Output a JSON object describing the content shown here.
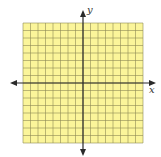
{
  "diagram": {
    "type": "coordinate-grid",
    "grid": {
      "cells_x": 16,
      "cells_y": 16,
      "left": 23,
      "top": 23,
      "right": 143,
      "bottom": 143,
      "fill_color": "#fbf59a",
      "line_color": "#8e8a55"
    },
    "axes": {
      "color": "#2a2a2a",
      "origin_x": 83,
      "origin_y": 83,
      "x_label": "x",
      "y_label": "y"
    }
  }
}
